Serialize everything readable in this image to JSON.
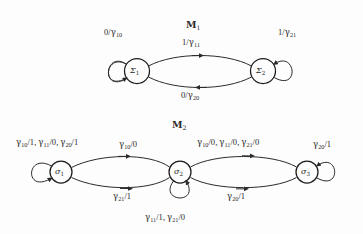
{
  "figure": {
    "background_color": "#fdfdfd",
    "ink_color": "#2b2b2b",
    "type": "state-transition-diagram"
  },
  "machines": [
    {
      "id": "M1",
      "title": "ऑ1",
      "title_glyph": "M",
      "title_sub": "1",
      "states": [
        {
          "id": "S1",
          "glyph": "Σ",
          "sub": "1",
          "cx": 137,
          "cy": 71
        },
        {
          "id": "S2",
          "glyph": "Σ",
          "sub": "2",
          "cx": 263,
          "cy": 71
        }
      ],
      "transitions": [
        {
          "name": "self-loop-sigma1",
          "from": "S1",
          "to": "S1",
          "input": "0",
          "output": "γ",
          "output_sub": "10",
          "label": "0/γ10"
        },
        {
          "name": "sigma1-to-sigma2",
          "from": "S1",
          "to": "S2",
          "input": "1",
          "output": "γ",
          "output_sub": "11",
          "label": "1/γ11"
        },
        {
          "name": "sigma2-to-sigma1",
          "from": "S2",
          "to": "S1",
          "input": "0",
          "output": "γ",
          "output_sub": "20",
          "label": "0/γ20"
        },
        {
          "name": "self-loop-sigma2",
          "from": "S2",
          "to": "S2",
          "input": "1",
          "output": "γ",
          "output_sub": "21",
          "label": "1/γ21"
        }
      ]
    },
    {
      "id": "M2",
      "title": "ऑ2",
      "title_glyph": "M",
      "title_sub": "2",
      "states": [
        {
          "id": "s1",
          "glyph": "σ",
          "sub": "1",
          "cx": 61,
          "cy": 172
        },
        {
          "id": "s2",
          "glyph": "σ",
          "sub": "2",
          "cx": 180,
          "cy": 172
        },
        {
          "id": "s3",
          "glyph": "σ",
          "sub": "3",
          "cx": 307,
          "cy": 172
        }
      ],
      "transitions": [
        {
          "name": "self-loop-s1",
          "from": "s1",
          "to": "s1",
          "label": "γ10/1, γ11/0, γ20/1"
        },
        {
          "name": "s1-to-s2",
          "from": "s1",
          "to": "s2",
          "label": "γ10/0"
        },
        {
          "name": "s2-to-s1",
          "from": "s2",
          "to": "s1",
          "label": "γ21/1"
        },
        {
          "name": "s2-to-s3",
          "from": "s2",
          "to": "s3",
          "label": "γ10/0, γ11/0, γ21/0"
        },
        {
          "name": "s3-to-s2",
          "from": "s3",
          "to": "s2",
          "label": "γ20/1"
        },
        {
          "name": "self-loop-s2",
          "from": "s2",
          "to": "s2",
          "label": "γ11/1, γ21/0"
        },
        {
          "name": "self-loop-s3",
          "from": "s3",
          "to": "s3",
          "label": "γ20/1"
        }
      ]
    }
  ],
  "labels": {
    "m1_title": "M",
    "m1_title_sub": "1",
    "m2_title": "M",
    "m2_title_sub": "2",
    "m1_selfloop_left_num": "0",
    "m1_selfloop_left_den": "γ",
    "m1_selfloop_left_den_sub": "10",
    "m1_top_num": "1",
    "m1_top_den": "γ",
    "m1_top_den_sub": "11",
    "m1_bottom_num": "0",
    "m1_bottom_den": "γ",
    "m1_bottom_den_sub": "20",
    "m1_selfloop_right_num": "1",
    "m1_selfloop_right_den": "γ",
    "m1_selfloop_right_den_sub": "21",
    "m1_state1": "Σ",
    "m1_state1_sub": "1",
    "m1_state2": "Σ",
    "m1_state2_sub": "2",
    "m2_state1": "σ",
    "m2_state1_sub": "1",
    "m2_state2": "σ",
    "m2_state2_sub": "2",
    "m2_state3": "σ",
    "m2_state3_sub": "3",
    "m2_top_mid_sym": "γ",
    "m2_top_mid_sub": "10",
    "m2_top_mid_out": "/0",
    "m2_bot_left_sym": "γ",
    "m2_bot_left_sub": "21",
    "m2_bot_left_out": "/1",
    "m2_bot_right_sym": "γ",
    "m2_bot_right_sub": "20",
    "m2_bot_right_out": "/1",
    "m2_selfloop_right_sym": "γ",
    "m2_selfloop_right_sub": "20",
    "m2_selfloop_right_out": "/1"
  }
}
